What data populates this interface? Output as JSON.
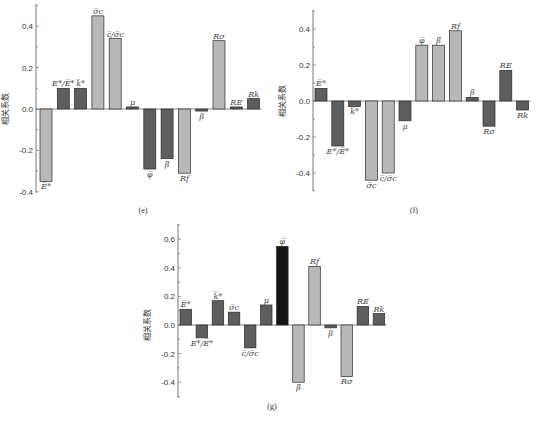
{
  "colors": {
    "light": "#b8b8b8",
    "dark": "#5e5e5e",
    "black": "#141414",
    "axis": "#555555",
    "stroke": "#2a2a2a"
  },
  "chart_data": [
    {
      "type": "bar",
      "panel": "(e)",
      "title": "",
      "xlabel": "",
      "ylabel": "相关系数",
      "ylim": [
        -0.4,
        0.5
      ],
      "yticks": [
        -0.4,
        -0.2,
        0.0,
        0.2,
        0.4
      ],
      "ytick_labels": [
        "-0.4",
        "-0.2",
        "0.0",
        "0.2",
        "0.4"
      ],
      "grid": false,
      "categories": [
        "E̅*",
        "E*/E̅*",
        "k̅*",
        "σ̅c",
        "c̅/σ̅c",
        "μ",
        "φ̅",
        "β̅",
        "Rf",
        "β",
        "Rσ",
        "RE",
        "Rk"
      ],
      "values": [
        -0.35,
        0.1,
        0.1,
        0.45,
        0.34,
        0.01,
        -0.29,
        -0.24,
        -0.31,
        -0.01,
        0.33,
        0.01,
        0.05
      ],
      "shades": [
        "light",
        "dark",
        "dark",
        "light",
        "light",
        "dark",
        "dark",
        "dark",
        "light",
        "dark",
        "light",
        "dark",
        "dark"
      ]
    },
    {
      "type": "bar",
      "panel": "(f)",
      "title": "",
      "xlabel": "",
      "ylabel": "相关系数",
      "ylim": [
        -0.5,
        0.5
      ],
      "yticks": [
        -0.4,
        -0.2,
        0.0,
        0.2,
        0.4
      ],
      "ytick_labels": [
        "-0.4",
        "-0.2",
        "0.0",
        "0.2",
        "0.4"
      ],
      "grid": false,
      "categories": [
        "E̅*",
        "E*/E̅*",
        "k̅*",
        "σ̅c",
        "c̅/σ̅c",
        "μ",
        "φ̅",
        "β̅",
        "Rf",
        "β",
        "Rσ",
        "RE",
        "Rk"
      ],
      "values": [
        0.07,
        -0.25,
        -0.03,
        -0.44,
        -0.4,
        -0.11,
        0.31,
        0.31,
        0.39,
        0.02,
        -0.14,
        0.17,
        -0.05
      ],
      "shades": [
        "dark",
        "dark",
        "dark",
        "light",
        "light",
        "dark",
        "light",
        "light",
        "light",
        "dark",
        "dark",
        "dark",
        "dark"
      ]
    },
    {
      "type": "bar",
      "panel": "(g)",
      "title": "",
      "xlabel": "",
      "ylabel": "相关系数",
      "ylim": [
        -0.5,
        0.7
      ],
      "yticks": [
        -0.4,
        -0.2,
        0.0,
        0.2,
        0.4,
        0.6
      ],
      "ytick_labels": [
        "-0.4",
        "-0.2",
        "0.0",
        "0.2",
        "0.4",
        "0.6"
      ],
      "grid": false,
      "categories": [
        "E̅*",
        "E*/E̅*",
        "k̅*",
        "σ̅c",
        "c̅/σ̅c",
        "μ",
        "φ̅",
        "β̅",
        "Rf",
        "β",
        "Rσ",
        "RE",
        "Rk"
      ],
      "values": [
        0.11,
        -0.09,
        0.17,
        0.09,
        -0.16,
        0.14,
        0.55,
        -0.4,
        0.41,
        -0.02,
        -0.36,
        0.13,
        0.08
      ],
      "shades": [
        "dark",
        "dark",
        "dark",
        "dark",
        "dark",
        "dark",
        "black",
        "light",
        "light",
        "dark",
        "light",
        "dark",
        "dark"
      ]
    }
  ],
  "layout": [
    {
      "axisX": 36,
      "zeroY": 109,
      "pxPerUnit": 207,
      "axisTop": 4,
      "axisBottom": 193,
      "barStart": 40,
      "barStep": 17.3,
      "barWidth": 12,
      "ylabelX": 8,
      "ylabelY": 109,
      "panelX": 143,
      "panelY": 213
    },
    {
      "axisX": 313,
      "zeroY": 101,
      "pxPerUnit": 180,
      "axisTop": 10,
      "axisBottom": 191,
      "barStart": 315,
      "barStep": 16.8,
      "barWidth": 12,
      "ylabelX": 285,
      "ylabelY": 101,
      "panelX": 414,
      "panelY": 213
    },
    {
      "axisX": 178,
      "zeroY": 325,
      "pxPerUnit": 143,
      "axisTop": 224,
      "axisBottom": 398,
      "barStart": 180,
      "barStep": 16.1,
      "barWidth": 11.5,
      "ylabelX": 150,
      "ylabelY": 325,
      "panelX": 272,
      "panelY": 409
    }
  ]
}
